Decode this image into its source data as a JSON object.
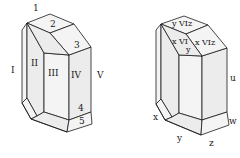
{
  "figures": [
    {
      "name": "crystal-roman-faces",
      "labels": {
        "top_1": "1",
        "top_2": "2",
        "top_3": "3",
        "bottom_4": "4",
        "bottom_5": "5",
        "face_I": "I",
        "face_II": "II",
        "face_III": "III",
        "face_IV": "IV",
        "face_V": "V"
      }
    },
    {
      "name": "crystal-letter-faces",
      "labels": {
        "top_yviz": "y VIz",
        "mid_xvi": "x VI",
        "mid_xviz": "x VIz",
        "mid_y": "y",
        "side_u": "u",
        "bottom_x": "x",
        "bottom_y": "y",
        "bottom_z": "z",
        "bottom_w": "w"
      }
    }
  ]
}
